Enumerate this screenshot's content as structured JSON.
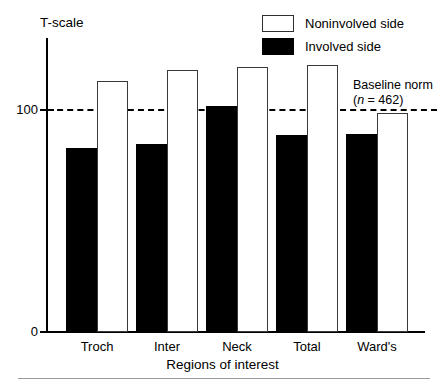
{
  "chart_data": {
    "type": "bar",
    "title": "",
    "xlabel": "Regions of interest",
    "ylabel": "T-scale",
    "categories": [
      "Troch",
      "Inter",
      "Neck",
      "Total",
      "Ward's"
    ],
    "series": [
      {
        "name": "Involved side",
        "color": "#000000",
        "values": [
          81.5,
          83,
          100,
          87,
          87.5
        ]
      },
      {
        "name": "Noninvolved side",
        "color": "#ffffff",
        "values": [
          111,
          116,
          117,
          118,
          97
        ]
      }
    ],
    "ylim": [
      0,
      130
    ],
    "yticks": [
      0,
      100
    ],
    "ytick_labels": [
      "0",
      "100"
    ],
    "grid": false,
    "legend_position": "top-right",
    "annotations": [
      {
        "name": "baseline-norm",
        "line_value": 100,
        "text": "Baseline norm",
        "subtext_prefix": "(",
        "subtext_italic": "n",
        "subtext_suffix": " = 462)",
        "style": "dashed"
      }
    ]
  },
  "axis": {
    "y_title": "T-scale",
    "y_tick_100": "100",
    "y_tick_0": "0",
    "x_title": "Regions of interest"
  },
  "legend": {
    "items": [
      {
        "label": "Noninvolved side",
        "swatch": "open-rect-swatch"
      },
      {
        "label": "Involved side",
        "swatch": "filled-rect-swatch"
      }
    ]
  },
  "baseline": {
    "title": "Baseline norm",
    "paren_open": "(",
    "n_symbol": "n",
    "n_value": " = 462)"
  },
  "groups": [
    {
      "label": "Troch"
    },
    {
      "label": "Inter"
    },
    {
      "label": "Neck"
    },
    {
      "label": "Total"
    },
    {
      "label": "Ward's"
    }
  ]
}
